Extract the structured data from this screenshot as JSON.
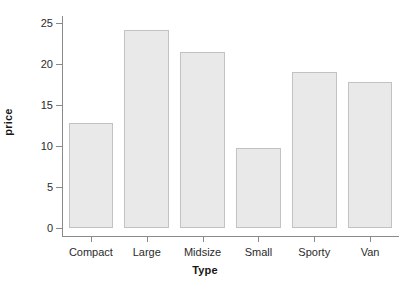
{
  "chart_data": {
    "type": "bar",
    "title": "",
    "subtitle": "",
    "xlabel": "Type",
    "ylabel": "price",
    "categories": [
      "Compact",
      "Large",
      "Midsize",
      "Small",
      "Sporty",
      "Van"
    ],
    "values": [
      12.8,
      24.1,
      21.5,
      9.8,
      19.0,
      17.8
    ],
    "series": [
      {
        "name": "price",
        "values": [
          12.8,
          24.1,
          21.5,
          9.8,
          19.0,
          17.8
        ]
      }
    ],
    "ylim": [
      0,
      26.5
    ],
    "xlim": [
      0,
      6
    ],
    "yticks": [
      0,
      5,
      10,
      15,
      20,
      25
    ],
    "ytick_labels": [
      "0",
      "5",
      "10",
      "15",
      "20",
      "25"
    ],
    "xtick_labels": [
      "Compact",
      "Large",
      "Midsize",
      "Small",
      "Sporty",
      "Van"
    ],
    "grid": false,
    "legend": false,
    "legend_position": "none",
    "bar_fill_color": "#e9e9e9",
    "bar_border_color": "#c2c2c2",
    "axis_color": "#8a8a8a",
    "text_color": "#2b2b2b",
    "title_color": "#161616",
    "background_color": "#ffffff",
    "annotations": []
  },
  "axes": {
    "y_ticks": [
      {
        "label": "25",
        "value": 25
      },
      {
        "label": "20",
        "value": 20
      },
      {
        "label": "15",
        "value": 15
      },
      {
        "label": "10",
        "value": 10
      },
      {
        "label": "5",
        "value": 5
      },
      {
        "label": "0",
        "value": 0
      }
    ],
    "x_ticks": [
      {
        "label": "Compact"
      },
      {
        "label": "Large"
      },
      {
        "label": "Midsize"
      },
      {
        "label": "Small"
      },
      {
        "label": "Sporty"
      },
      {
        "label": "Van"
      }
    ],
    "x_title": "Type",
    "y_title": "price"
  }
}
